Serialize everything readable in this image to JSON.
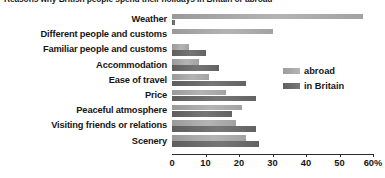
{
  "chart_data": {
    "type": "bar",
    "orientation": "horizontal",
    "title": "Reasons why British people spend their holidays in Britain or abroad",
    "xlabel": "",
    "ylabel": "",
    "xlim": [
      0,
      60
    ],
    "grid": false,
    "legend_position": "right-upper",
    "tick_labels": [
      "0",
      "10",
      "20",
      "30",
      "40",
      "50",
      "60%"
    ],
    "tick_values": [
      0,
      10,
      20,
      30,
      40,
      50,
      60
    ],
    "categories": [
      "Weather",
      "Different people and customs",
      "Familiar people and customs",
      "Accommodation",
      "Ease of travel",
      "Price",
      "Peaceful atmosphere",
      "Visiting friends or relations",
      "Scenery"
    ],
    "series": [
      {
        "name": "abroad",
        "color": "#adadad",
        "values": [
          57,
          30,
          5,
          8,
          11,
          16,
          21,
          19,
          22
        ]
      },
      {
        "name": "in Britain",
        "color": "#6b6b6b",
        "values": [
          1,
          0,
          10,
          14,
          22,
          25,
          18,
          25,
          26
        ]
      }
    ]
  },
  "legend": {
    "items": [
      {
        "label": "abroad",
        "key": "abroad"
      },
      {
        "label": "in Britain",
        "key": "britain"
      }
    ]
  }
}
